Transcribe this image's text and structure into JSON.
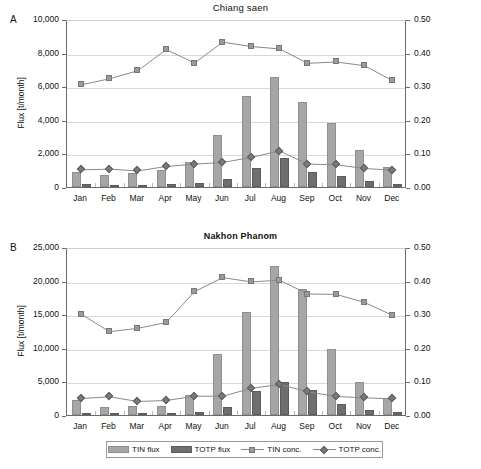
{
  "figure": {
    "legend": [
      {
        "name": "TIN flux",
        "kind": "bar",
        "color": "#a6a6a6"
      },
      {
        "name": "TOTP flux",
        "kind": "bar",
        "color": "#6e6e6e"
      },
      {
        "name": "TIN conc.",
        "kind": "line-square",
        "color": "#9a9a9a"
      },
      {
        "name": "TOTP conc.",
        "kind": "line-diamond",
        "color": "#7a7a7a"
      }
    ]
  },
  "chart_data": [
    {
      "panel": "A",
      "type": "bar",
      "title": "Chiang saen",
      "xlabel": "",
      "ylabel": "Flux [t/month]",
      "y2label": "Concentration [mg/l]",
      "categories": [
        "Jan",
        "Feb",
        "Mar",
        "Apr",
        "May",
        "Jun",
        "Jul",
        "Aug",
        "Sep",
        "Oct",
        "Nov",
        "Dec"
      ],
      "ylim": [
        0,
        10000
      ],
      "yticks": [
        "0",
        "2,000",
        "4,000",
        "6,000",
        "8,000",
        "10,000"
      ],
      "ytick_values": [
        0,
        2000,
        4000,
        6000,
        8000,
        10000
      ],
      "y2lim": [
        0,
        0.5
      ],
      "y2ticks": [
        "0.00",
        "0.10",
        "0.20",
        "0.30",
        "0.40",
        "0.50"
      ],
      "y2tick_values": [
        0.0,
        0.1,
        0.2,
        0.3,
        0.4,
        0.5
      ],
      "grid": true,
      "legend_position": "bottom",
      "series": [
        {
          "name": "TIN flux",
          "axis": "left",
          "render": "bar",
          "values": [
            900,
            740,
            810,
            1040,
            1510,
            3120,
            5420,
            6520,
            5070,
            3790,
            2230,
            1220
          ]
        },
        {
          "name": "TOTP flux",
          "axis": "left",
          "render": "bar",
          "values": [
            160,
            90,
            80,
            150,
            260,
            490,
            1140,
            1710,
            920,
            680,
            340,
            170
          ]
        },
        {
          "name": "TIN conc.",
          "axis": "right",
          "render": "line-square",
          "values": [
            0.31,
            0.328,
            0.352,
            0.415,
            0.375,
            0.437,
            0.424,
            0.417,
            0.374,
            0.378,
            0.367,
            0.322
          ]
        },
        {
          "name": "TOTP conc.",
          "axis": "right",
          "render": "line-diamond",
          "values": [
            0.057,
            0.059,
            0.054,
            0.067,
            0.074,
            0.079,
            0.094,
            0.113,
            0.074,
            0.072,
            0.061,
            0.056
          ]
        }
      ]
    },
    {
      "panel": "B",
      "type": "bar",
      "title": "Nakhon Phanom",
      "xlabel": "",
      "ylabel": "Flux [t/month]",
      "y2label": "Concentration [mg/l]",
      "categories": [
        "Jan",
        "Feb",
        "Mar",
        "Apr",
        "May",
        "Jun",
        "Jul",
        "Aug",
        "Sep",
        "Oct",
        "Nov",
        "Dec"
      ],
      "ylim": [
        0,
        25000
      ],
      "yticks": [
        "0",
        "5,000",
        "10,000",
        "15,000",
        "20,000",
        "25,000"
      ],
      "ytick_values": [
        0,
        5000,
        10000,
        15000,
        20000,
        25000
      ],
      "y2lim": [
        0,
        0.5
      ],
      "y2ticks": [
        "0.00",
        "0.10",
        "0.20",
        "0.30",
        "0.40",
        "0.50"
      ],
      "y2tick_values": [
        0.0,
        0.1,
        0.2,
        0.3,
        0.4,
        0.5
      ],
      "grid": true,
      "legend_position": "bottom",
      "series": [
        {
          "name": "TIN flux",
          "axis": "left",
          "render": "bar",
          "values": [
            2200,
            1150,
            1280,
            1400,
            2950,
            9100,
            15400,
            22200,
            18800,
            9850,
            4900,
            2600
          ]
        },
        {
          "name": "TOTP flux",
          "axis": "left",
          "render": "bar",
          "values": [
            330,
            250,
            260,
            270,
            460,
            1250,
            3550,
            4900,
            3750,
            1700,
            700,
            380
          ]
        },
        {
          "name": "TIN conc.",
          "axis": "right",
          "render": "line-square",
          "values": [
            0.306,
            0.254,
            0.264,
            0.281,
            0.373,
            0.415,
            0.402,
            0.407,
            0.366,
            0.365,
            0.341,
            0.302
          ]
        },
        {
          "name": "TOTP conc.",
          "axis": "right",
          "render": "line-diamond",
          "values": [
            0.055,
            0.06,
            0.046,
            0.049,
            0.062,
            0.062,
            0.085,
            0.097,
            0.075,
            0.061,
            0.057,
            0.054
          ]
        }
      ]
    }
  ]
}
